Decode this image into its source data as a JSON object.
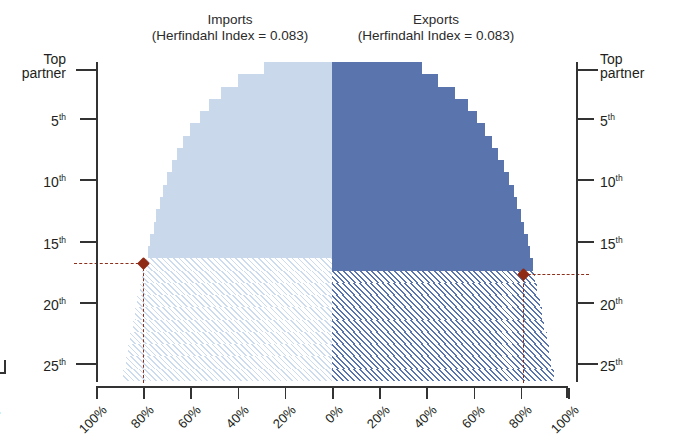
{
  "figure": {
    "type": "tornado-step-chart",
    "width": 674,
    "height": 442
  },
  "panels": {
    "left": {
      "name": "imports",
      "title": "Imports",
      "subtitle": "(Herfindahl Index = 0.083)",
      "color": "#c9d8ea",
      "hatch_color": "#ccdcee",
      "direction": "left"
    },
    "right": {
      "name": "exports",
      "title": "Exports",
      "subtitle": "(Herfindahl Index = 0.083)",
      "color": "#5a74ae",
      "hatch_color": "#5a74ae",
      "direction": "right"
    }
  },
  "axes": {
    "y_left": {
      "label_top": "Top",
      "label_top_2": "partner",
      "ticks": [
        "Top partner",
        "5",
        "10",
        "15",
        "20",
        "25"
      ],
      "tick_suffix": "th",
      "tick_values": [
        1,
        5,
        10,
        15,
        20,
        25
      ]
    },
    "y_right": {
      "label_top": "Top",
      "label_top_2": "partner",
      "ticks": [
        "Top partner",
        "5",
        "10",
        "15",
        "20",
        "25"
      ],
      "tick_suffix": "th",
      "tick_values": [
        1,
        5,
        10,
        15,
        20,
        25
      ]
    },
    "x": {
      "labels_left": [
        "100%",
        "80%",
        "60%",
        "40%",
        "20%",
        "0%"
      ],
      "labels_right": [
        "20%",
        "40%",
        "60%",
        "80%",
        "100%"
      ],
      "cropped_label": "0%",
      "range": [
        0,
        100
      ],
      "unit": "%"
    }
  },
  "markers": {
    "left": {
      "label": "imports-threshold-marker",
      "color": "#8f2b14",
      "rank": 16,
      "cumulative_share": 80
    },
    "right": {
      "label": "exports-threshold-marker",
      "color": "#8f2b14",
      "rank": 17,
      "cumulative_share": 86
    }
  },
  "chart_data": {
    "type": "bar",
    "orientation": "horizontal-tornado",
    "xlabel": "",
    "ylabel": "",
    "xlim": [
      100,
      100
    ],
    "ylim": [
      1,
      26
    ],
    "grid": false,
    "legend": "none",
    "categories": [
      "Top partner",
      "2nd",
      "3rd",
      "4th",
      "5th",
      "6th",
      "7th",
      "8th",
      "9th",
      "10th",
      "11th",
      "12th",
      "13th",
      "14th",
      "15th",
      "16th",
      "17th",
      "18th",
      "19th",
      "20th",
      "21st",
      "22nd",
      "23rd",
      "24th",
      "25th",
      "26th"
    ],
    "series": [
      {
        "name": "Imports",
        "axis": "left",
        "color": "#c9d8ea",
        "units": "% cumulative share",
        "values": [
          29,
          40,
          47,
          52,
          56,
          60,
          63,
          65.5,
          68,
          70,
          71.5,
          73,
          74.5,
          75.5,
          77,
          78,
          79,
          80.5,
          81.5,
          82.5,
          83.5,
          84.5,
          85.5,
          86.5,
          87.5,
          88.5
        ],
        "solid_through_rank": 16,
        "hatched_from_rank": 17
      },
      {
        "name": "Exports",
        "axis": "right",
        "color": "#5a74ae",
        "units": "% cumulative share",
        "values": [
          38,
          45,
          52,
          57.5,
          61.5,
          65,
          68,
          70.5,
          73,
          75,
          77,
          78.5,
          80,
          81.5,
          83,
          84,
          85,
          86,
          87,
          88,
          89,
          90,
          91,
          92,
          93,
          94
        ],
        "solid_through_rank": 17,
        "hatched_from_rank": 18
      }
    ],
    "annotations": [
      {
        "name": "imports-threshold",
        "rank": 16,
        "share": 80,
        "style": "dashed-leader-with-diamond"
      },
      {
        "name": "exports-threshold",
        "rank": 17,
        "share": 86,
        "style": "dashed-leader-with-diamond"
      }
    ]
  }
}
